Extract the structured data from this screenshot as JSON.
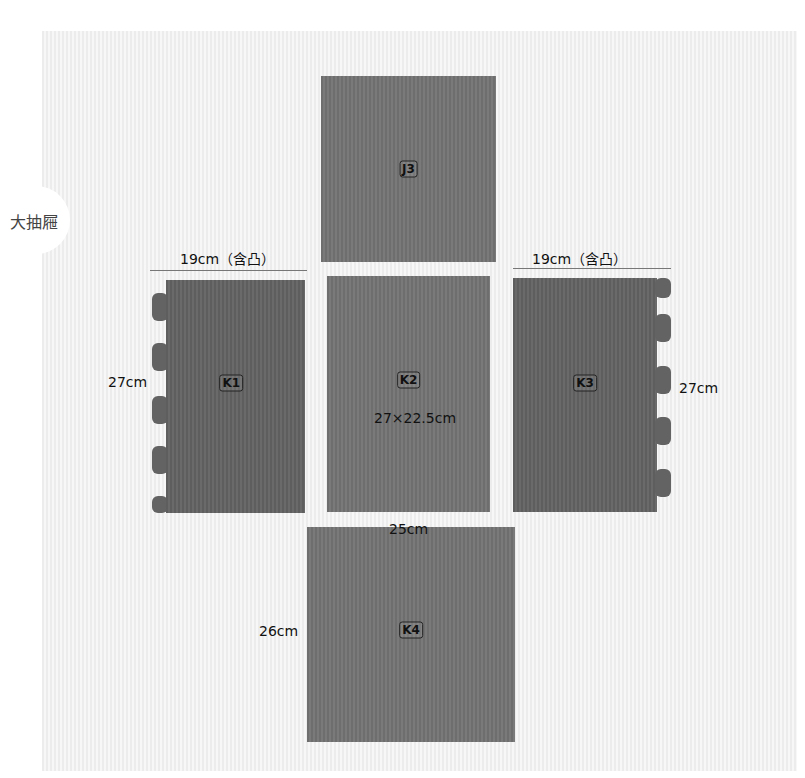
{
  "section_label": "大抽屜",
  "pieces": [
    {
      "id": "J3"
    },
    {
      "id": "K1"
    },
    {
      "id": "K2"
    },
    {
      "id": "K3"
    },
    {
      "id": "K4"
    }
  ],
  "dimensions": {
    "k1_width": "19cm（含凸）",
    "k1_height": "27cm",
    "k2_size": "27×22.5cm",
    "k3_width": "19cm（含凸）",
    "k3_height": "27cm",
    "k4_width": "25cm",
    "k4_height": "26cm"
  },
  "colors": {
    "background": "#f2f2f2",
    "piece": "#727272"
  }
}
